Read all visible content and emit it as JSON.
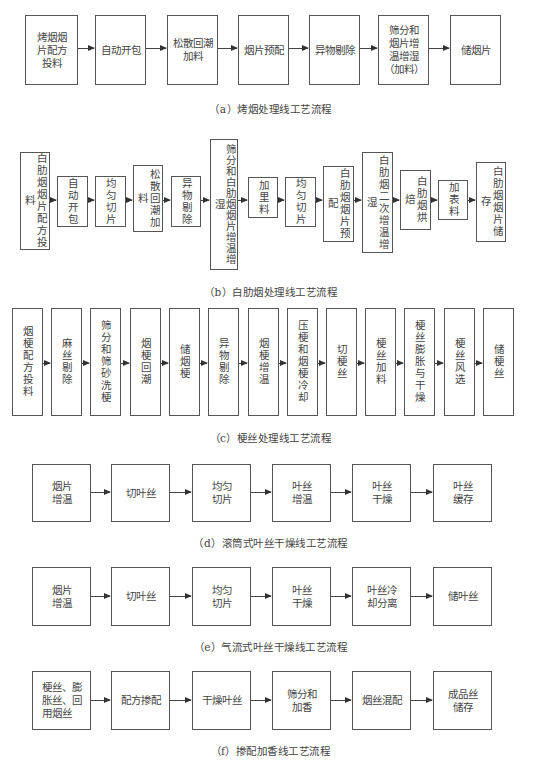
{
  "diagrams": {
    "a": {
      "caption": "（a）烤烟处理线工艺流程",
      "steps": [
        "烤烟烟\n片配方\n投料",
        "自动开包",
        "松散回潮\n加料",
        "烟片预配",
        "异物剔除",
        "筛分和\n烟片增\n温增湿\n（加料）",
        "储烟片"
      ]
    },
    "b": {
      "caption": "（b）白肋烟处理线工艺流程",
      "steps": [
        "白肋烟烟片配方投料",
        "自动开包",
        "均匀切片",
        "松散回潮加料",
        "异物剔除",
        "筛分和白肋烟烟片增温增湿",
        "加里料",
        "均匀切片",
        "白肋烟烟片预配",
        "白肋烟二次增温增湿",
        "白肋烟烘焙",
        "加表料",
        "白肋烟烟片储存"
      ]
    },
    "c": {
      "caption": "（c）梗丝处理线工艺流程",
      "steps": [
        "烟梗配方投料",
        "麻丝剔除",
        "筛分和筛砂洗梗",
        "烟梗回潮",
        "储烟梗",
        "异物剔除",
        "烟梗增温",
        "压梗和烟梗冷却",
        "切梗丝",
        "梗丝加料",
        "梗丝膨胀与干燥",
        "梗丝风选",
        "储梗丝"
      ]
    },
    "d": {
      "caption": "（d）滚筒式叶丝干燥线工艺流程",
      "steps": [
        "烟片\n增温",
        "切叶丝",
        "均匀\n切片",
        "叶丝\n增温",
        "叶丝\n干燥",
        "叶丝\n缓存"
      ]
    },
    "e": {
      "caption": "（e）气流式叶丝干燥线工艺流程",
      "steps": [
        "烟片\n增温",
        "切叶丝",
        "均匀\n切片",
        "叶丝\n干燥",
        "叶丝冷\n却分离",
        "储叶丝"
      ]
    },
    "f": {
      "caption": "（f）掺配加香线工艺流程",
      "steps": [
        "梗丝、膨\n胀丝、回\n用烟丝",
        "配方掺配",
        "干燥叶丝",
        "筛分和\n加香",
        "烟丝混配",
        "成品丝\n储存"
      ]
    }
  }
}
